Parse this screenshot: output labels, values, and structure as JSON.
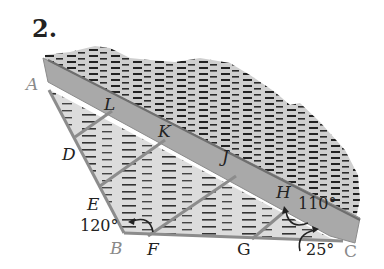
{
  "problem_number": "2.",
  "points": {
    "A": "A",
    "B": "B",
    "C": "C",
    "D": "D",
    "E": "E",
    "F": "F",
    "G": "G",
    "H": "H",
    "J": "J",
    "K": "K",
    "L": "L"
  },
  "angles": {
    "angle_B": "120°",
    "angle_H": "110°",
    "angle_C": "25°"
  },
  "colors": {
    "band": "#a9a9a9",
    "land": "#d6d6d6",
    "edge": "#8c8c8c",
    "text": "#222222",
    "vertex_gray": "#8a8a8a"
  }
}
